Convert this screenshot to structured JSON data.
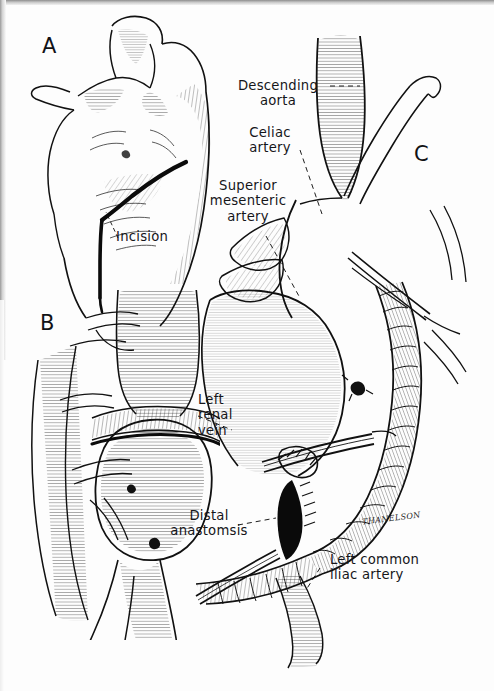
{
  "figure": {
    "style": "pen-and-ink line drawing, black on white",
    "ink_color": "#111216",
    "paper_color": "#fdfdfd"
  },
  "panels": [
    {
      "id": "A",
      "letter": "A",
      "caption": "Torso with thoracoabdominal incision"
    },
    {
      "id": "B",
      "letter": "B",
      "caption": "Exposed aorta and aneurysm with left renal vein"
    },
    {
      "id": "C",
      "letter": "C",
      "caption": "Graft in place with distal anastomosis"
    }
  ],
  "labels": {
    "incision": "Incision",
    "descending_aorta": "Descending\naorta",
    "celiac_artery": "Celiac\nartery",
    "superior_mesenteric_artery": "Superior\nmesenteric\nartery",
    "left_renal_vein": "Left\nrenal\nvein",
    "distal_anastomsis": "Distal\nanastomsis",
    "left_common_iliac_artery": "Left common\niliac artery"
  },
  "signature": "THANELSON"
}
